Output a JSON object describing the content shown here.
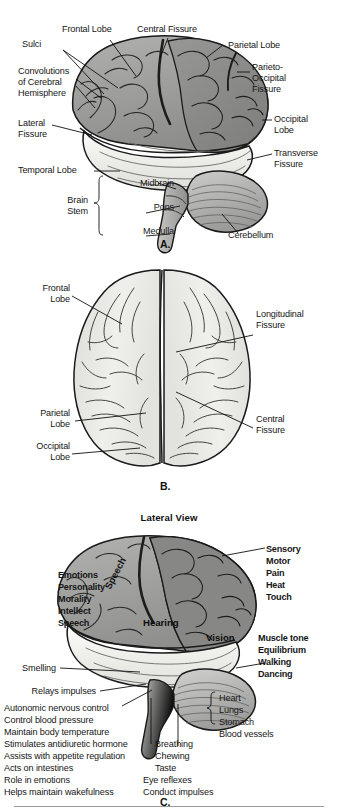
{
  "figure": {
    "type": "anatomical-illustration",
    "panels": [
      {
        "letter": "A.",
        "view": "Lateral (side) view of the brain",
        "labels_left": [
          {
            "text": "Frontal Lobe"
          },
          {
            "text": "Sulci"
          },
          {
            "text": "Convolutions"
          },
          {
            "text": "of Cerebral"
          },
          {
            "text": "Hemisphere"
          },
          {
            "text": "Lateral"
          },
          {
            "text": "Fissure"
          },
          {
            "text": "Temporal Lobe"
          },
          {
            "text": "Brain"
          },
          {
            "text": "Stem"
          }
        ],
        "labels_center": [
          {
            "text": "Central Fissure"
          },
          {
            "text": "Midbrain"
          },
          {
            "text": "Pons"
          },
          {
            "text": "Medulla"
          }
        ],
        "labels_right": [
          {
            "text": "Parietal Lobe"
          },
          {
            "text": "Parieto-"
          },
          {
            "text": "Occipital"
          },
          {
            "text": "Fissure"
          },
          {
            "text": "Occipital"
          },
          {
            "text": "Lobe"
          },
          {
            "text": "Transverse"
          },
          {
            "text": "Fissure"
          },
          {
            "text": "Cerebellum"
          }
        ]
      },
      {
        "letter": "B.",
        "view": "Superior (top) view of the brain",
        "labels_left": [
          {
            "text": "Frontal"
          },
          {
            "text": "Lobe"
          },
          {
            "text": "Parietal"
          },
          {
            "text": "Lobe"
          },
          {
            "text": "Occipital"
          },
          {
            "text": "Lobe"
          }
        ],
        "labels_right": [
          {
            "text": "Longitudinal"
          },
          {
            "text": "Fissure"
          },
          {
            "text": "Central"
          },
          {
            "text": "Fissure"
          }
        ]
      },
      {
        "letter": "C.",
        "title": "Lateral View",
        "view": "Functional areas of the brain",
        "frontal_functions": [
          "Emotions",
          "Personality",
          "Morality",
          "Intellect",
          "Speech"
        ],
        "on_brain": [
          {
            "text": "Speech",
            "rotated": true
          },
          {
            "text": "Hearing",
            "rotated": false
          },
          {
            "text": "Vision",
            "rotated": false
          }
        ],
        "parietal_functions": [
          "Sensory",
          "Motor",
          "Pain",
          "Heat",
          "Touch"
        ],
        "cerebellum_functions": [
          "Muscle tone",
          "Equilibrium",
          "Walking",
          "Dancing"
        ],
        "pointer_labels": [
          "Smelling",
          "Relays impulses"
        ],
        "hypothalamus_list": [
          "Autonomic nervous control",
          "Control blood pressure",
          "Maintain body temperature",
          "Stimulates antidiuretic hormone",
          "Assists with appetite regulation",
          "Acts on intestines",
          "Role in emotions",
          "Helps maintain wakefulness"
        ],
        "pons_list": [
          "Breathing",
          "Chewing",
          "Taste"
        ],
        "medulla_list": [
          "Eye reflexes",
          "Conduct impulses"
        ],
        "organ_list": [
          "Heart",
          "Lungs",
          "Stomach",
          "Blood vessels"
        ]
      }
    ]
  },
  "colors": {
    "background": "#ffffff",
    "text": "#161616",
    "cortex_mid_gray": "#9a9a9a",
    "cortex_dark_gray": "#8a8a8a",
    "temporal_light": "#f0f0ee",
    "cerebellum_gray": "#b4b4b2",
    "outline": "#1a1a1a",
    "panel_b_fill": "#e9e9e6",
    "rule_gray": "#9a9a9a"
  }
}
